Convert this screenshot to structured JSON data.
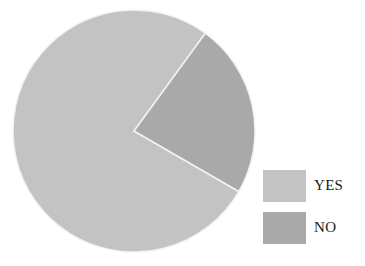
{
  "chart_data": {
    "type": "pie",
    "title": "",
    "categories": [
      "YES",
      "NO"
    ],
    "values": [
      76.7,
      23.3
    ],
    "colors": [
      "#c3c3c3",
      "#a9a9a9"
    ],
    "start_angle_deg": 120,
    "legend_position": "right-bottom"
  },
  "legend": {
    "items": [
      {
        "label": "YES",
        "color": "#c3c3c3"
      },
      {
        "label": "NO",
        "color": "#a9a9a9"
      }
    ]
  }
}
